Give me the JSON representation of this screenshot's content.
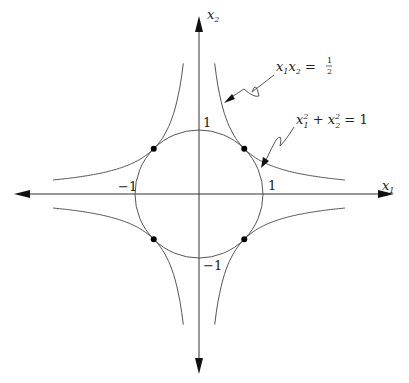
{
  "diagram": {
    "axes": {
      "x_label": {
        "var": "x",
        "sub": "1"
      },
      "y_label": {
        "var": "x",
        "sub": "2"
      }
    },
    "ticks": {
      "x_pos": "1",
      "x_neg": "−1",
      "y_pos": "1",
      "y_neg": "−1"
    },
    "curves": [
      {
        "name": "hyperbola",
        "equation": "x1 x2 = 1/2",
        "label_parts": {
          "a": "x",
          "a_sub": "1",
          "b": "x",
          "b_sub": "2",
          "eq": " = ",
          "num": "1",
          "den": "2"
        }
      },
      {
        "name": "circle",
        "equation": "x1^2 + x2^2 = 1",
        "label_parts": {
          "a": "x",
          "a_sup": "2",
          "a_sub": "1",
          "plus": " + ",
          "b": "x",
          "b_sup": "2",
          "b_sub": "2",
          "eq": " = 1"
        }
      }
    ],
    "intersection_points": [
      [
        0.7071,
        0.7071
      ],
      [
        -0.7071,
        0.7071
      ],
      [
        -0.7071,
        -0.7071
      ],
      [
        0.7071,
        -0.7071
      ]
    ],
    "colors": {
      "curve": "#555555",
      "axis": "#333333",
      "point": "#000000"
    }
  }
}
